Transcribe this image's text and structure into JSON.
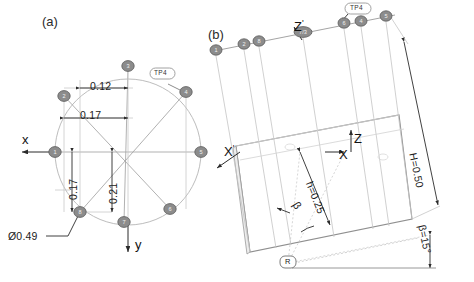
{
  "figure": {
    "type": "engineering-diagram",
    "panels": [
      {
        "id": "a",
        "label": "(a)",
        "caption_x": 48,
        "caption_y": 22
      },
      {
        "id": "b",
        "label": "(b)",
        "caption_x": 212,
        "caption_y": 34
      }
    ]
  },
  "panel_a": {
    "title": "(a)",
    "view": "circular cross-section with eight numbered positions",
    "circle": {
      "cx": 128,
      "cy": 152,
      "r": 73,
      "diameter_label": "Ø0.49"
    },
    "axes": [
      {
        "name": "x",
        "label": "x",
        "direction": "left",
        "lx": 22,
        "ly": 140
      },
      {
        "name": "y",
        "label": "y",
        "direction": "down",
        "lx": 137,
        "ly": 252
      }
    ],
    "nodes": [
      {
        "id": "1",
        "label": "1",
        "cx": 55,
        "cy": 152
      },
      {
        "id": "2",
        "label": "2",
        "cx": 64,
        "cy": 96
      },
      {
        "id": "3",
        "label": "3",
        "cx": 128,
        "cy": 66
      },
      {
        "id": "4",
        "label": "4",
        "cx": 186,
        "cy": 92
      },
      {
        "id": "5",
        "label": "5",
        "cx": 201,
        "cy": 152
      },
      {
        "id": "6",
        "label": "6",
        "cx": 170,
        "cy": 209
      },
      {
        "id": "7",
        "label": "7",
        "cx": 124,
        "cy": 222
      },
      {
        "id": "8",
        "label": "8",
        "cx": 80,
        "cy": 212
      }
    ],
    "callout": {
      "label": "TP4",
      "x": 155,
      "y": 76
    },
    "dimensions": [
      {
        "id": "d-012",
        "value": "0.12",
        "orientation": "horizontal",
        "lx": 92,
        "ly": 94
      },
      {
        "id": "d-017h",
        "value": "0.17",
        "orientation": "horizontal",
        "lx": 92,
        "ly": 123
      },
      {
        "id": "d-017v",
        "value": "0.17",
        "orientation": "vertical",
        "lx": 64,
        "ly": 196
      },
      {
        "id": "d-021v",
        "value": "0.21",
        "orientation": "vertical",
        "lx": 104,
        "ly": 200
      },
      {
        "id": "d-dia",
        "value": "Ø0.49",
        "orientation": "leader",
        "lx": 8,
        "ly": 240
      }
    ]
  },
  "panel_b": {
    "title": "(b)",
    "view": "tilted cylinder side view with eight positions along top edge",
    "nodes": [
      {
        "id": "1",
        "label": "1",
        "cx": 216,
        "cy": 50
      },
      {
        "id": "2",
        "label": "2",
        "cx": 244,
        "cy": 44
      },
      {
        "id": "8",
        "label": "8",
        "cx": 259,
        "cy": 41
      },
      {
        "id": "7/3",
        "label": "7/3",
        "cx": 303,
        "cy": 32
      },
      {
        "id": "6",
        "label": "6",
        "cx": 344,
        "cy": 23
      },
      {
        "id": "4",
        "label": "4",
        "cx": 361,
        "cy": 21
      },
      {
        "id": "5",
        "label": "5",
        "cx": 386,
        "cy": 16
      }
    ],
    "callout": {
      "label": "TP4",
      "x": 358,
      "y": 5
    },
    "marker_r": {
      "label": "R",
      "x": 288,
      "y": 263
    },
    "axes": [
      {
        "name": "z-prime",
        "label": "Z",
        "prime": true,
        "lx": 297,
        "ly": 27
      },
      {
        "name": "x-prime",
        "label": "X",
        "prime": true,
        "lx": 226,
        "ly": 152
      },
      {
        "name": "z",
        "label": "Z",
        "prime": false,
        "lx": 358,
        "ly": 140
      },
      {
        "name": "x",
        "label": "X",
        "prime": false,
        "lx": 343,
        "ly": 154
      }
    ],
    "dimensions": [
      {
        "id": "H",
        "value": "H=0.50",
        "orientation": "rotated",
        "lx": 420,
        "ly": 152
      },
      {
        "id": "h",
        "value": "h=0.25",
        "orientation": "rotated",
        "lx": 316,
        "ly": 215
      },
      {
        "id": "beta",
        "value": "β=15°",
        "orientation": "rotated",
        "lx": 432,
        "ly": 267
      },
      {
        "id": "beta-angle-symbol",
        "value": "β",
        "orientation": "inline",
        "lx": 304,
        "ly": 206
      }
    ]
  },
  "style": {
    "node_fill": "#8c8c8c",
    "node_stroke": "#5a5a5a",
    "line": "#9a9a9a",
    "line_dark": "#7d7d7d",
    "dim_line": "#2b2b2b",
    "construction": "#c9c9c9",
    "text": "#1a1a1a"
  }
}
